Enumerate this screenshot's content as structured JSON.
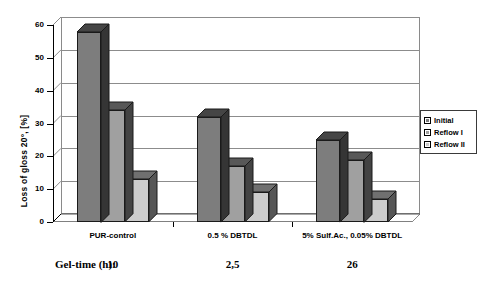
{
  "chart_data": {
    "type": "bar",
    "title": "",
    "xlabel": "",
    "ylabel": "Loss of gloss 20°, [%]",
    "ylim": [
      0,
      60
    ],
    "yticks": [
      0,
      10,
      20,
      30,
      40,
      50,
      60
    ],
    "ytick_labels": [
      "0",
      "10",
      "20",
      "30",
      "40",
      "50",
      "60"
    ],
    "grid": true,
    "legend_position": "right",
    "style": "3d-bar",
    "categories": [
      "PUR-control",
      "0.5 % DBTDL",
      "5% Sulf.Ac., 0.05% DBTDL"
    ],
    "series": [
      {
        "name": "Initial",
        "values": [
          58,
          32,
          25
        ],
        "color": "#7d7d7d"
      },
      {
        "name": "Reflow I",
        "values": [
          34,
          17,
          19
        ],
        "color": "#a0a0a0"
      },
      {
        "name": "Reflow II",
        "values": [
          13,
          9,
          7
        ],
        "color": "#cccccc"
      }
    ],
    "annotations": {
      "gel_time_label": "Gel-time (h):",
      "gel_time_values": [
        "10",
        "2,5",
        "26"
      ]
    }
  },
  "legend": {
    "entries": [
      {
        "label": "Initial",
        "color": "#7d7d7d"
      },
      {
        "label": "Reflow I",
        "color": "#a0a0a0"
      },
      {
        "label": "Reflow II",
        "color": "#cccccc"
      }
    ]
  },
  "colors": {
    "series_1": "#7d7d7d",
    "series_2": "#a0a0a0",
    "series_3": "#cccccc",
    "grid": "#8c8c8c",
    "axis": "#000000",
    "background": "#ffffff"
  }
}
